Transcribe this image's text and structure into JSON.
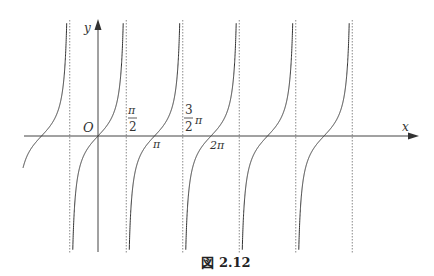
{
  "figure": {
    "caption_prefix": "図",
    "caption_number": "2.12"
  },
  "chart_data": {
    "type": "line",
    "function": "y = tan x",
    "xlabel": "x",
    "ylabel": "y",
    "origin_label": "O",
    "x_tick_labels": [
      {
        "label_num": "π",
        "label_den": "2",
        "label_suffix": "",
        "value": 1.5708,
        "kind": "asymptote"
      },
      {
        "label_num": "3",
        "label_den": "2",
        "label_suffix": "π",
        "value": 4.7124,
        "kind": "asymptote"
      },
      {
        "label": "π",
        "value": 3.1416,
        "kind": "zero"
      },
      {
        "label": "2π",
        "value": 6.2832,
        "kind": "zero"
      }
    ],
    "asymptotes_x": [
      -1.5708,
      1.5708,
      4.7124,
      7.854,
      10.9956,
      14.1372
    ],
    "zeros_x": [
      -3.1416,
      0,
      3.1416,
      6.2832,
      9.4248,
      12.5664
    ],
    "x_range": [
      -4.2,
      13.6
    ],
    "grid": false,
    "asymptote_style": "dotted"
  },
  "labels": {
    "x_axis": "x",
    "y_axis": "y",
    "origin": "O",
    "half_pi_num": "π",
    "half_pi_den": "2",
    "three_half_num": "3",
    "three_half_den": "2",
    "three_half_suffix": "π",
    "pi": "π",
    "two_pi": "2π"
  },
  "colors": {
    "curve": "#333333",
    "axis": "#444444",
    "asymptote": "#888888"
  }
}
